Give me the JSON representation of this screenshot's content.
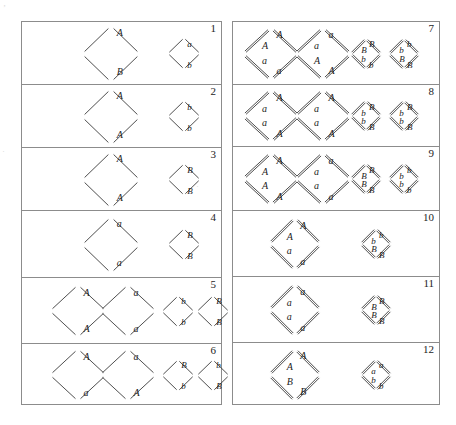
{
  "figure": {
    "columns": [
      {
        "id": "left",
        "rows": [
          "1",
          "2",
          "3",
          "4",
          "5",
          "6"
        ]
      },
      {
        "id": "right",
        "rows": [
          "7",
          "8",
          "9",
          "10",
          "11",
          "12"
        ]
      }
    ]
  },
  "rows": [
    {
      "number": "1",
      "column": "left",
      "style": "single",
      "large": [
        {
          "labels": {
            "outer_top": "A",
            "inner_top": "",
            "inner_bottom": "",
            "outer_bottom": "B"
          }
        }
      ],
      "small": [
        {
          "labels": {
            "outer_top": "a",
            "inner_top": "",
            "inner_bottom": "",
            "outer_bottom": "b"
          }
        }
      ]
    },
    {
      "number": "2",
      "column": "left",
      "style": "single",
      "large": [
        {
          "labels": {
            "outer_top": "A",
            "inner_top": "",
            "inner_bottom": "",
            "outer_bottom": "A"
          }
        }
      ],
      "small": [
        {
          "labels": {
            "outer_top": "b",
            "inner_top": "",
            "inner_bottom": "",
            "outer_bottom": "b"
          }
        }
      ]
    },
    {
      "number": "3",
      "column": "left",
      "style": "single",
      "large": [
        {
          "labels": {
            "outer_top": "A",
            "inner_top": "",
            "inner_bottom": "",
            "outer_bottom": "A"
          }
        }
      ],
      "small": [
        {
          "labels": {
            "outer_top": "B",
            "inner_top": "",
            "inner_bottom": "",
            "outer_bottom": "B"
          }
        }
      ]
    },
    {
      "number": "4",
      "column": "left",
      "style": "single",
      "large": [
        {
          "labels": {
            "outer_top": "a",
            "inner_top": "",
            "inner_bottom": "",
            "outer_bottom": "a"
          }
        }
      ],
      "small": [
        {
          "labels": {
            "outer_top": "B",
            "inner_top": "",
            "inner_bottom": "",
            "outer_bottom": "B"
          }
        }
      ]
    },
    {
      "number": "5",
      "column": "left",
      "style": "single",
      "large": [
        {
          "labels": {
            "outer_top": "A",
            "inner_top": "",
            "inner_bottom": "",
            "outer_bottom": "A"
          }
        },
        {
          "labels": {
            "outer_top": "a",
            "inner_top": "",
            "inner_bottom": "",
            "outer_bottom": "a"
          }
        }
      ],
      "small": [
        {
          "labels": {
            "outer_top": "b",
            "inner_top": "",
            "inner_bottom": "",
            "outer_bottom": "b"
          }
        },
        {
          "labels": {
            "outer_top": "B",
            "inner_top": "",
            "inner_bottom": "",
            "outer_bottom": "B"
          }
        }
      ]
    },
    {
      "number": "6",
      "column": "left",
      "style": "single",
      "large": [
        {
          "labels": {
            "outer_top": "A",
            "inner_top": "",
            "inner_bottom": "",
            "outer_bottom": "a"
          }
        },
        {
          "labels": {
            "outer_top": "a",
            "inner_top": "",
            "inner_bottom": "",
            "outer_bottom": "A"
          }
        }
      ],
      "small": [
        {
          "labels": {
            "outer_top": "B",
            "inner_top": "",
            "inner_bottom": "",
            "outer_bottom": "b"
          }
        },
        {
          "labels": {
            "outer_top": "b",
            "inner_top": "",
            "inner_bottom": "",
            "outer_bottom": "B"
          }
        }
      ]
    },
    {
      "number": "7",
      "column": "right",
      "style": "double",
      "large": [
        {
          "labels": {
            "outer_top": "A",
            "inner_top": "A",
            "inner_bottom": "a",
            "outer_bottom": "a"
          }
        },
        {
          "labels": {
            "outer_top": "a",
            "inner_top": "a",
            "inner_bottom": "A",
            "outer_bottom": "A"
          }
        }
      ],
      "small": [
        {
          "labels": {
            "outer_top": "B",
            "inner_top": "B",
            "inner_bottom": "b",
            "outer_bottom": "b"
          }
        },
        {
          "labels": {
            "outer_top": "b",
            "inner_top": "b",
            "inner_bottom": "B",
            "outer_bottom": "B"
          }
        }
      ]
    },
    {
      "number": "8",
      "column": "right",
      "style": "double",
      "large": [
        {
          "labels": {
            "outer_top": "A",
            "inner_top": "a",
            "inner_bottom": "a",
            "outer_bottom": "A"
          }
        },
        {
          "labels": {
            "outer_top": "A",
            "inner_top": "a",
            "inner_bottom": "a",
            "outer_bottom": "A"
          }
        }
      ],
      "small": [
        {
          "labels": {
            "outer_top": "B",
            "inner_top": "b",
            "inner_bottom": "b",
            "outer_bottom": "B"
          }
        },
        {
          "labels": {
            "outer_top": "B",
            "inner_top": "b",
            "inner_bottom": "b",
            "outer_bottom": "B"
          }
        }
      ]
    },
    {
      "number": "9",
      "column": "right",
      "style": "double",
      "large": [
        {
          "labels": {
            "outer_top": "A",
            "inner_top": "A",
            "inner_bottom": "A",
            "outer_bottom": "A"
          }
        },
        {
          "labels": {
            "outer_top": "a",
            "inner_top": "a",
            "inner_bottom": "a",
            "outer_bottom": "a"
          }
        }
      ],
      "small": [
        {
          "labels": {
            "outer_top": "B",
            "inner_top": "B",
            "inner_bottom": "B",
            "outer_bottom": "B"
          }
        },
        {
          "labels": {
            "outer_top": "b",
            "inner_top": "b",
            "inner_bottom": "b",
            "outer_bottom": "b"
          }
        }
      ]
    },
    {
      "number": "10",
      "column": "right",
      "style": "double",
      "large": [
        {
          "labels": {
            "outer_top": "A",
            "inner_top": "A",
            "inner_bottom": "a",
            "outer_bottom": "a"
          }
        }
      ],
      "small": [
        {
          "labels": {
            "outer_top": "b",
            "inner_top": "b",
            "inner_bottom": "B",
            "outer_bottom": "B"
          }
        }
      ]
    },
    {
      "number": "11",
      "column": "right",
      "style": "double",
      "large": [
        {
          "labels": {
            "outer_top": "a",
            "inner_top": "a",
            "inner_bottom": "a",
            "outer_bottom": "a"
          }
        }
      ],
      "small": [
        {
          "labels": {
            "outer_top": "B",
            "inner_top": "B",
            "inner_bottom": "B",
            "outer_bottom": "B"
          }
        }
      ]
    },
    {
      "number": "12",
      "column": "right",
      "style": "double",
      "large": [
        {
          "labels": {
            "outer_top": "A",
            "inner_top": "A",
            "inner_bottom": "B",
            "outer_bottom": "B"
          }
        }
      ],
      "small": [
        {
          "labels": {
            "outer_top": "a",
            "inner_top": "a",
            "inner_bottom": "b",
            "outer_bottom": "b"
          }
        }
      ]
    }
  ],
  "colors": {
    "ink": "#2b2b2b",
    "rule": "#8c8c8c",
    "page": "#ffffff"
  }
}
